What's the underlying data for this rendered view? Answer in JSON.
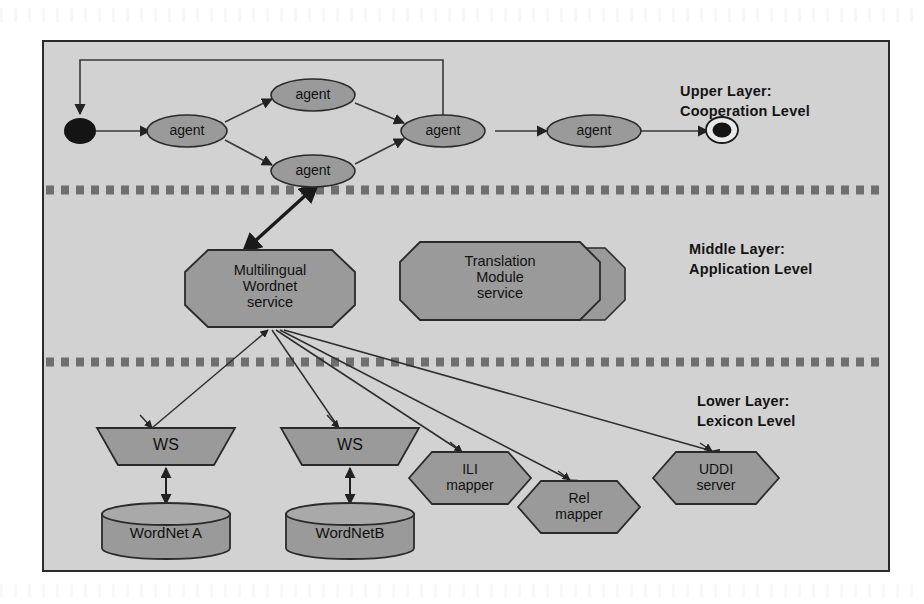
{
  "diagram": {
    "background_color": "#d2d2d2",
    "node_fill": "#9a9a9a",
    "stroke_color": "#2b2b2b"
  },
  "layers": [
    {
      "id": "upper",
      "caption": "Upper Layer:\nCooperation Level"
    },
    {
      "id": "middle",
      "caption": "Middle Layer:\nApplication Level"
    },
    {
      "id": "lower",
      "caption": "Lower Layer:\nLexicon Level"
    }
  ],
  "upper_layer": {
    "start_node": "start",
    "end_node": "end",
    "agents": [
      {
        "id": "agent1",
        "label": "agent"
      },
      {
        "id": "agent2",
        "label": "agent"
      },
      {
        "id": "agent3",
        "label": "agent"
      },
      {
        "id": "agent4",
        "label": "agent"
      },
      {
        "id": "agent5",
        "label": "agent"
      }
    ]
  },
  "middle_layer": {
    "services": [
      {
        "id": "mlwn",
        "label": "Multilingual\nWordnet\nservice",
        "shape": "octagon"
      },
      {
        "id": "trans",
        "label": "Translation\nModule\nservice",
        "shape": "octagon-stacked"
      }
    ]
  },
  "lower_layer": {
    "web_services": [
      {
        "id": "ws-a",
        "label": "WS",
        "shape": "trapezoid"
      },
      {
        "id": "ws-b",
        "label": "WS",
        "shape": "trapezoid"
      }
    ],
    "databases": [
      {
        "id": "wordnet-a",
        "label": "WordNet A",
        "shape": "cylinder"
      },
      {
        "id": "wordnet-b",
        "label": "WordNetB",
        "shape": "cylinder"
      }
    ],
    "components": [
      {
        "id": "ili",
        "label": "ILI\nmapper",
        "shape": "hexagon"
      },
      {
        "id": "rel",
        "label": "Rel\nmapper",
        "shape": "hexagon"
      },
      {
        "id": "uddi",
        "label": "UDDI\nserver",
        "shape": "hexagon"
      }
    ]
  }
}
